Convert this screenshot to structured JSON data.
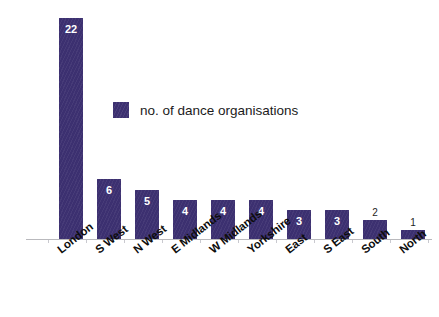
{
  "chart_data": {
    "type": "bar",
    "title": "",
    "subtitle": "",
    "xlabel": "",
    "ylabel": "",
    "grid": false,
    "legend_position": "inside-upper-center",
    "ylim": [
      0,
      23
    ],
    "axis_range_note": "baseline at 0, tallest bar 22",
    "categories": [
      "London",
      "S West",
      "N West",
      "E Midlands",
      "W Midlands",
      "Yorkshire",
      "East",
      "S East",
      "South",
      "North"
    ],
    "values": [
      22,
      6,
      5,
      4,
      4,
      4,
      3,
      3,
      2,
      1
    ],
    "value_labels": [
      "22",
      "6",
      "5",
      "4",
      "4",
      "4",
      "3",
      "3",
      "2",
      "1"
    ],
    "series": [
      {
        "name": "no. of dance organisations",
        "values": [
          22,
          6,
          5,
          4,
          4,
          4,
          3,
          3,
          2,
          1
        ]
      }
    ],
    "legend": [
      "no. of dance organisations"
    ],
    "colors": {
      "bar": "#3C3070",
      "axis": "#B9B9BD",
      "value_label_inside": "#FFFFFF",
      "value_label_outside": "#1D1D1D",
      "category_label": "#0D0D0D",
      "background": "#FFFFFF"
    }
  },
  "legend": {
    "label": "no. of dance organisations"
  }
}
